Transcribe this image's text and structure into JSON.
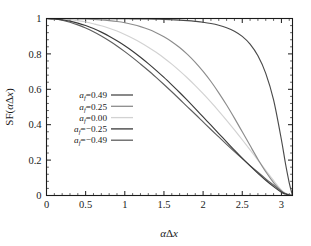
{
  "figure": {
    "background": "#ffffff",
    "axis_color": "#1b1b1b"
  },
  "axes": {
    "x": {
      "label": "αΔx",
      "label_parts": {
        "alpha": "α",
        "delta": "Δ",
        "x": "x"
      },
      "ticks": [
        "0",
        "0.5",
        "1",
        "1.5",
        "2",
        "2.5",
        "3"
      ],
      "tick_values": [
        0,
        0.5,
        1,
        1.5,
        2,
        2.5,
        3
      ],
      "min": 0,
      "max": 3.14159,
      "minor_ticks_per_interval": 5
    },
    "y": {
      "label": "SF(αΔx)",
      "label_parts": {
        "prefix": "SF(",
        "alpha": "α",
        "delta": "Δ",
        "x": "x",
        "suffix": ")"
      },
      "ticks": [
        "0",
        "0.2",
        "0.4",
        "0.6",
        "0.8",
        "1"
      ],
      "tick_values": [
        0,
        0.2,
        0.4,
        0.6,
        0.8,
        1
      ],
      "min": 0,
      "max": 1,
      "minor_ticks_per_interval": 5
    }
  },
  "legend": {
    "position": "center-left",
    "entries": [
      {
        "prefix": "a",
        "subscript": "f",
        "equals": "=",
        "value": "0.49",
        "color": "#4a4a4a"
      },
      {
        "prefix": "a",
        "subscript": "f",
        "equals": "=",
        "value": "0.25",
        "color": "#8c8c8c"
      },
      {
        "prefix": "a",
        "subscript": "f",
        "equals": "=",
        "value": "0.00",
        "color": "#d2d2d2"
      },
      {
        "prefix": "a",
        "subscript": "f",
        "equals": "=",
        "value": "−0.25",
        "color": "#3a3a3a"
      },
      {
        "prefix": "a",
        "subscript": "f",
        "equals": "=",
        "value": "−0.49",
        "color": "#5e5e5e"
      }
    ]
  },
  "chart_data": {
    "type": "line",
    "title": "",
    "xlabel": "αΔx",
    "ylabel": "SF(αΔx)",
    "xlim": [
      0,
      3.14159
    ],
    "ylim": [
      0,
      1
    ],
    "grid": false,
    "legend_position": "center-left",
    "x": [
      0,
      0.1,
      0.2,
      0.3,
      0.4,
      0.5,
      0.6,
      0.7,
      0.8,
      0.9,
      1.0,
      1.1,
      1.2,
      1.3,
      1.4,
      1.5,
      1.6,
      1.7,
      1.8,
      1.9,
      2.0,
      2.1,
      2.2,
      2.3,
      2.4,
      2.5,
      2.6,
      2.7,
      2.8,
      2.9,
      3.0,
      3.05,
      3.1,
      3.14159
    ],
    "series": [
      {
        "name": "a_f = 0.49",
        "label": "a_f=0.49",
        "color": "#4a4a4a",
        "values": [
          1.0,
          1.0,
          1.0,
          1.0,
          1.0,
          1.0,
          1.0,
          1.0,
          0.999,
          0.999,
          0.999,
          0.998,
          0.998,
          0.997,
          0.996,
          0.995,
          0.993,
          0.991,
          0.988,
          0.984,
          0.979,
          0.972,
          0.962,
          0.948,
          0.928,
          0.899,
          0.855,
          0.789,
          0.69,
          0.54,
          0.315,
          0.185,
          0.072,
          0.0
        ]
      },
      {
        "name": "a_f = 0.25",
        "label": "a_f=0.25",
        "color": "#8c8c8c",
        "values": [
          1.0,
          1.0,
          0.999,
          0.999,
          0.998,
          0.997,
          0.995,
          0.992,
          0.988,
          0.983,
          0.976,
          0.966,
          0.954,
          0.939,
          0.92,
          0.897,
          0.869,
          0.836,
          0.797,
          0.752,
          0.701,
          0.644,
          0.58,
          0.511,
          0.437,
          0.36,
          0.282,
          0.205,
          0.134,
          0.073,
          0.025,
          0.011,
          0.003,
          0.0
        ]
      },
      {
        "name": "a_f = 0.00",
        "label": "a_f=0.00",
        "color": "#d2d2d2",
        "values": [
          1.0,
          0.999,
          0.997,
          0.993,
          0.987,
          0.98,
          0.97,
          0.959,
          0.945,
          0.929,
          0.91,
          0.889,
          0.865,
          0.838,
          0.809,
          0.777,
          0.742,
          0.704,
          0.664,
          0.621,
          0.575,
          0.527,
          0.477,
          0.425,
          0.371,
          0.315,
          0.258,
          0.2,
          0.142,
          0.085,
          0.031,
          0.014,
          0.004,
          0.0
        ]
      },
      {
        "name": "a_f = −0.25",
        "label": "a_f=−0.25",
        "color": "#3a3a3a",
        "values": [
          1.0,
          0.998,
          0.993,
          0.985,
          0.974,
          0.96,
          0.943,
          0.923,
          0.9,
          0.874,
          0.846,
          0.815,
          0.781,
          0.745,
          0.707,
          0.667,
          0.625,
          0.582,
          0.537,
          0.491,
          0.444,
          0.397,
          0.35,
          0.303,
          0.256,
          0.211,
          0.167,
          0.125,
          0.086,
          0.05,
          0.018,
          0.008,
          0.002,
          0.0
        ]
      },
      {
        "name": "a_f = −0.49",
        "label": "a_f=−0.49",
        "color": "#5e5e5e",
        "values": [
          1.0,
          0.997,
          0.99,
          0.979,
          0.964,
          0.946,
          0.925,
          0.901,
          0.874,
          0.845,
          0.813,
          0.779,
          0.743,
          0.706,
          0.667,
          0.627,
          0.586,
          0.544,
          0.501,
          0.459,
          0.416,
          0.373,
          0.331,
          0.289,
          0.248,
          0.208,
          0.169,
          0.131,
          0.094,
          0.059,
          0.024,
          0.011,
          0.003,
          0.0
        ]
      }
    ]
  }
}
